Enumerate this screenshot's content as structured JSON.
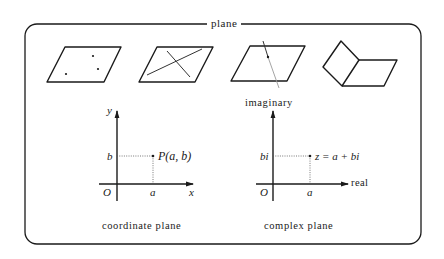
{
  "frame": {
    "title": "plane"
  },
  "illustrations": [
    {
      "name": "plane-with-three-points",
      "description": "parallelogram with three non-collinear points"
    },
    {
      "name": "plane-with-two-intersecting-lines",
      "description": "parallelogram containing two crossing lines"
    },
    {
      "name": "plane-pierced-by-line",
      "description": "line passing through a plane, lower portion shown lighter"
    },
    {
      "name": "two-intersecting-planes",
      "description": "two planes meeting along a common edge"
    }
  ],
  "coordinate_plane": {
    "caption": "coordinate plane",
    "y_axis_label": "y",
    "x_axis_label": "x",
    "origin_label": "O",
    "x_tick_label": "a",
    "y_tick_label": "b",
    "point_label": "P(a,  b)"
  },
  "complex_plane": {
    "caption": "complex plane",
    "vertical_axis_label": "imaginary",
    "horizontal_axis_label": "real",
    "origin_label": "O",
    "x_tick_label": "a",
    "y_tick_label": "bi",
    "point_label": "z = a + bi"
  },
  "colors": {
    "ink": "#1a1a1a",
    "light_line": "#9a9a9a",
    "background": "#ffffff"
  }
}
